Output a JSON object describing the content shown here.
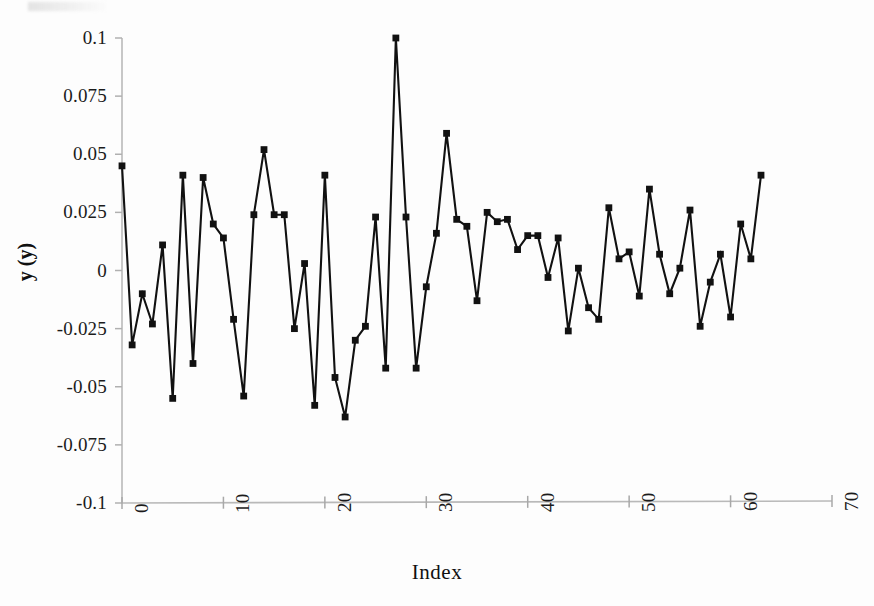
{
  "chart_data": {
    "type": "line",
    "title": "",
    "xlabel": "Index",
    "ylabel": "y (y)",
    "xlim": [
      0,
      70
    ],
    "ylim": [
      -0.1,
      0.1
    ],
    "xticks": [
      0,
      10,
      20,
      30,
      40,
      50,
      60,
      70
    ],
    "xtick_labels": [
      "0",
      "10",
      "20",
      "30",
      "40",
      "50",
      "60",
      "70"
    ],
    "yticks": [
      -0.1,
      -0.075,
      -0.05,
      -0.025,
      0,
      0.025,
      0.05,
      0.075,
      0.1
    ],
    "ytick_labels": [
      "-0.1",
      "-0.075",
      "-0.05",
      "-0.025",
      "0",
      "0.025",
      "0.05",
      "0.075",
      "0.1"
    ],
    "grid": false,
    "legend": null,
    "marker": "square",
    "marker_color": "#111111",
    "line_color": "#111111",
    "series": [
      {
        "name": "y",
        "x": [
          0,
          1,
          2,
          3,
          4,
          5,
          6,
          7,
          8,
          9,
          10,
          11,
          12,
          13,
          14,
          15,
          16,
          17,
          18,
          19,
          20,
          21,
          22,
          23,
          24,
          25,
          26,
          27,
          28,
          29,
          30,
          31,
          32,
          33,
          34,
          35,
          36,
          37,
          38,
          39,
          40,
          41,
          42,
          43,
          44,
          45,
          46,
          47,
          48,
          49,
          50,
          51,
          52,
          53,
          54,
          55,
          56,
          57,
          58,
          59,
          60,
          61,
          62,
          63
        ],
        "values": [
          0.045,
          -0.032,
          -0.01,
          -0.023,
          0.011,
          -0.055,
          0.041,
          -0.04,
          0.04,
          0.02,
          0.014,
          -0.021,
          -0.054,
          0.024,
          0.052,
          0.024,
          0.024,
          -0.025,
          0.003,
          -0.058,
          0.041,
          -0.046,
          -0.063,
          -0.03,
          -0.024,
          0.023,
          -0.042,
          0.1,
          0.023,
          -0.042,
          -0.007,
          0.016,
          0.059,
          0.022,
          0.019,
          -0.013,
          0.025,
          0.021,
          0.022,
          0.009,
          0.015,
          0.015,
          -0.003,
          0.014,
          -0.026,
          0.001,
          -0.016,
          -0.021,
          0.027,
          0.005,
          0.008,
          -0.011,
          0.035,
          0.007,
          -0.01,
          0.001,
          0.026,
          -0.024,
          -0.005,
          0.007,
          -0.02,
          0.02,
          0.005,
          0.041
        ]
      }
    ]
  },
  "axes": {
    "y_title": "y (y)",
    "x_title": "Index"
  }
}
